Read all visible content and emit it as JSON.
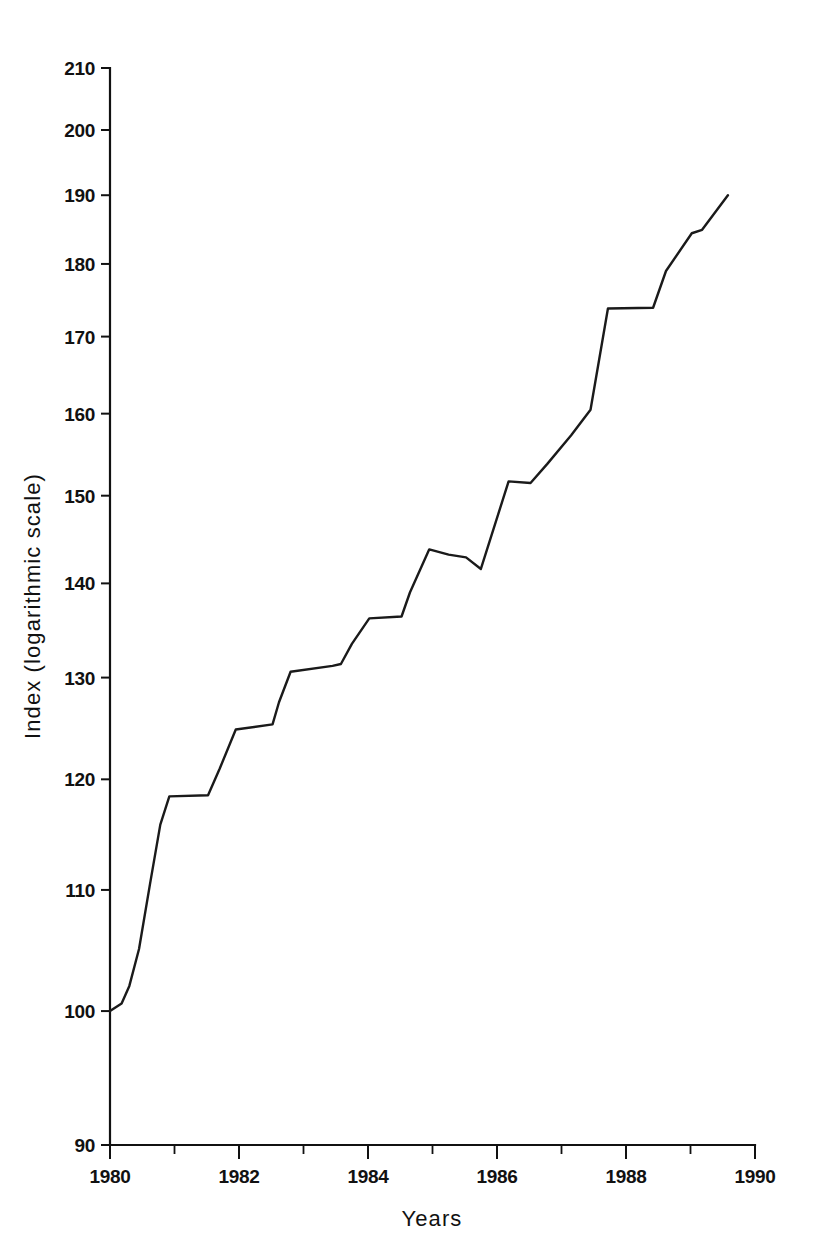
{
  "figure": {
    "background_color": "#ffffff",
    "line_color": "#1a1a1a",
    "text_color": "#111111"
  },
  "axes": {
    "x_title": "Years",
    "y_title": "Index (logarithmic scale)",
    "x_tick_labels": [
      "1980",
      "1982",
      "1984",
      "1986",
      "1988",
      "1990"
    ],
    "y_tick_labels": [
      "90",
      "100",
      "110",
      "120",
      "130",
      "140",
      "150",
      "160",
      "170",
      "180",
      "190",
      "200",
      "210"
    ]
  },
  "chart_data": {
    "type": "line",
    "title": "",
    "subtitle": "",
    "xlabel": "Years",
    "ylabel": "Index (logarithmic scale)",
    "xlim": [
      1980,
      1990
    ],
    "ylim": [
      90,
      210
    ],
    "yscale": "log",
    "xscale": "linear",
    "grid": false,
    "legend": null,
    "legend_position": "none",
    "x_ticks": [
      1980,
      1981,
      1982,
      1983,
      1984,
      1985,
      1986,
      1987,
      1988,
      1989,
      1990
    ],
    "x_tick_labels_shown": [
      1980,
      1982,
      1984,
      1986,
      1988,
      1990
    ],
    "y_ticks": [
      90,
      100,
      110,
      120,
      130,
      140,
      150,
      160,
      170,
      180,
      190,
      200,
      210
    ],
    "series": [
      {
        "name": "Index",
        "x": [
          1980.0,
          1980.18,
          1980.3,
          1980.45,
          1980.62,
          1980.78,
          1980.92,
          1981.52,
          1981.7,
          1981.95,
          1982.52,
          1982.62,
          1982.8,
          1983.45,
          1983.58,
          1983.75,
          1984.02,
          1984.52,
          1984.65,
          1984.95,
          1985.25,
          1985.52,
          1985.75,
          1986.18,
          1986.52,
          1986.78,
          1987.15,
          1987.45,
          1987.72,
          1988.42,
          1988.62,
          1989.02,
          1989.18,
          1989.58
        ],
        "y": [
          100.0,
          100.6,
          102.0,
          105.0,
          110.5,
          115.8,
          118.4,
          118.5,
          121.0,
          124.8,
          125.3,
          127.5,
          130.6,
          131.2,
          131.4,
          133.5,
          136.2,
          136.4,
          139.0,
          143.8,
          143.2,
          142.9,
          141.6,
          151.7,
          151.5,
          153.8,
          157.3,
          160.5,
          173.8,
          173.9,
          179.0,
          184.4,
          184.9,
          190.0
        ]
      }
    ]
  }
}
